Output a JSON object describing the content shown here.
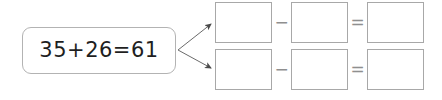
{
  "worksheet": {
    "background_color": "#ffffff",
    "card_border_color": "#b3b3b3",
    "box_border_color": "#a8a8a8",
    "operator_color": "#8f8f8f",
    "text_color": "#1f1f1f"
  },
  "source": {
    "equation": "35+26=61",
    "addend_one": "35",
    "addend_two": "26",
    "sum": "61"
  },
  "arrows": [
    {
      "name": "arrow-to-top-row",
      "from": "35+26=61",
      "to": "row-1"
    },
    {
      "name": "arrow-to-bottom-row",
      "from": "35+26=61",
      "to": "row-2"
    }
  ],
  "answer_rows": [
    {
      "id": "row-1",
      "cells": [
        {
          "value": "",
          "placeholder": ""
        },
        {
          "value": "",
          "placeholder": ""
        },
        {
          "value": "",
          "placeholder": ""
        }
      ],
      "operators": {
        "minus": "−",
        "equals": "="
      }
    },
    {
      "id": "row-2",
      "cells": [
        {
          "value": "",
          "placeholder": ""
        },
        {
          "value": "",
          "placeholder": ""
        },
        {
          "value": "",
          "placeholder": ""
        }
      ],
      "operators": {
        "minus": "−",
        "equals": "="
      }
    }
  ]
}
